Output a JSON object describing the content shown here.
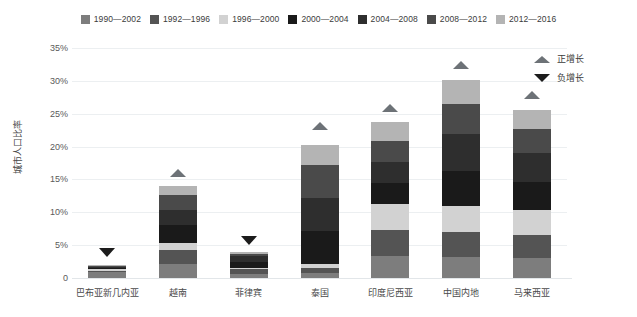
{
  "chart_data": {
    "type": "bar",
    "subtype": "stacked-bar",
    "title": "",
    "xlabel": "",
    "ylabel": "城市人口比率",
    "ylim": [
      0,
      35
    ],
    "ytick_labels": [
      "0",
      "5%",
      "10%",
      "15%",
      "20%",
      "25%",
      "30%",
      "35%"
    ],
    "ytick_values": [
      0,
      5,
      10,
      15,
      20,
      25,
      30,
      35
    ],
    "grid": true,
    "legend_position": "top-center",
    "categories": [
      "巴布亚新几内亚",
      "越南",
      "菲律宾",
      "泰国",
      "印度尼西亚",
      "中国内地",
      "马来西亚"
    ],
    "series": [
      {
        "name": "1990—2002",
        "color": "#7d7d7d",
        "values": [
          0.9,
          2.2,
          0.6,
          0.8,
          3.4,
          3.2,
          3.0
        ]
      },
      {
        "name": "1992—1996",
        "color": "#545454",
        "values": [
          0.2,
          2.0,
          0.7,
          0.7,
          3.9,
          3.8,
          3.6
        ]
      },
      {
        "name": "1996—2000",
        "color": "#d2d2d2",
        "values": [
          0.3,
          1.2,
          0.2,
          0.6,
          4.0,
          3.9,
          3.8
        ]
      },
      {
        "name": "2000—2004",
        "color": "#1a1a1a",
        "values": [
          0.2,
          2.6,
          0.9,
          5.0,
          3.1,
          5.4,
          4.2
        ]
      },
      {
        "name": "2004—2008",
        "color": "#2e2e2e",
        "values": [
          0.1,
          2.4,
          0.9,
          5.1,
          3.3,
          5.6,
          4.4
        ]
      },
      {
        "name": "2008—2012",
        "color": "#4a4a4a",
        "values": [
          0.1,
          2.3,
          0.4,
          5.0,
          3.2,
          4.6,
          3.7
        ]
      },
      {
        "name": "2012—2016",
        "color": "#b4b4b4",
        "values": [
          0.1,
          1.3,
          0.2,
          3.0,
          2.8,
          3.6,
          2.9
        ]
      }
    ],
    "totals": [
      1.9,
      14.0,
      3.9,
      20.2,
      23.7,
      30.1,
      25.6
    ],
    "markers": [
      {
        "category": "巴布亚新几内亚",
        "type": "negative",
        "y": 3.2
      },
      {
        "category": "越南",
        "type": "positive",
        "y": 15.4
      },
      {
        "category": "菲律宾",
        "type": "negative",
        "y": 5.0
      },
      {
        "category": "泰国",
        "type": "positive",
        "y": 22.6
      },
      {
        "category": "印度尼西亚",
        "type": "positive",
        "y": 25.2
      },
      {
        "category": "中国内地",
        "type": "positive",
        "y": 31.8
      },
      {
        "category": "马来西亚",
        "type": "positive",
        "y": 27.2
      }
    ],
    "marker_legend": [
      {
        "label": "正增长",
        "type": "positive",
        "color": "#6d7277"
      },
      {
        "label": "负增长",
        "type": "negative",
        "color": "#1c1c1c"
      }
    ]
  },
  "legend": {
    "items": [
      {
        "label": "1990—2002",
        "color": "#7d7d7d"
      },
      {
        "label": "1992—1996",
        "color": "#545454"
      },
      {
        "label": "1996—2000",
        "color": "#d2d2d2"
      },
      {
        "label": "2000—2004",
        "color": "#1a1a1a"
      },
      {
        "label": "2004—2008",
        "color": "#2e2e2e"
      },
      {
        "label": "2008—2012",
        "color": "#4a4a4a"
      },
      {
        "label": "2012—2016",
        "color": "#b4b4b4"
      }
    ]
  }
}
